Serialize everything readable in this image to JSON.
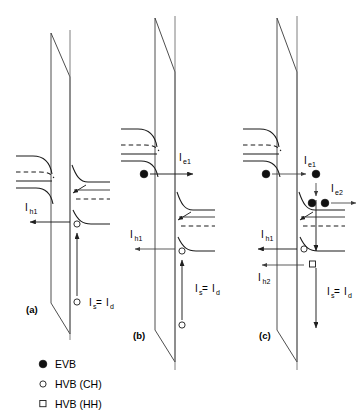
{
  "figure": {
    "panels": [
      {
        "id": "a",
        "panel_label": "(a)",
        "currents": [
          {
            "name": "I_h1",
            "base": "I",
            "sub": "h1"
          },
          {
            "name": "I_s = I_d",
            "base": "I",
            "sub": "s",
            "rest": " = I",
            "rest_sub": "d"
          }
        ],
        "carriers": [
          {
            "type": "HVB (CH)",
            "symbol": "open-circle"
          },
          {
            "type": "HVB (CH)",
            "symbol": "open-circle"
          }
        ]
      },
      {
        "id": "b",
        "panel_label": "(b)",
        "currents": [
          {
            "name": "I_e1",
            "base": "I",
            "sub": "e1"
          },
          {
            "name": "I_h1",
            "base": "I",
            "sub": "h1"
          },
          {
            "name": "I_s = I_d",
            "base": "I",
            "sub": "s",
            "rest": " = I",
            "rest_sub": "d"
          }
        ],
        "carriers": [
          {
            "type": "EVB",
            "symbol": "filled-circle"
          },
          {
            "type": "HVB (CH)",
            "symbol": "open-circle"
          },
          {
            "type": "HVB (CH)",
            "symbol": "open-circle"
          }
        ]
      },
      {
        "id": "c",
        "panel_label": "(c)",
        "currents": [
          {
            "name": "I_e1",
            "base": "I",
            "sub": "e1"
          },
          {
            "name": "I_e2",
            "base": "I",
            "sub": "e2"
          },
          {
            "name": "I_h1",
            "base": "I",
            "sub": "h1"
          },
          {
            "name": "I_h2",
            "base": "I",
            "sub": "h2"
          },
          {
            "name": "I_s = I_d",
            "base": "I",
            "sub": "s",
            "rest": " = I",
            "rest_sub": "d"
          }
        ],
        "carriers": [
          {
            "type": "EVB",
            "symbol": "filled-circle"
          },
          {
            "type": "EVB",
            "symbol": "filled-circle"
          },
          {
            "type": "EVB",
            "symbol": "filled-circle"
          },
          {
            "type": "EVB",
            "symbol": "filled-circle"
          },
          {
            "type": "HVB (CH)",
            "symbol": "open-circle"
          },
          {
            "type": "HVB (HH)",
            "symbol": "open-square"
          }
        ]
      }
    ],
    "labels": {
      "panel_a": "(a)",
      "panel_b": "(b)",
      "panel_c": "(c)",
      "I": "I",
      "e1": "e1",
      "e2": "e2",
      "h1": "h1",
      "h2": "h2",
      "s": "s",
      "d": "d",
      "equals": " = ",
      "I_e1_a": "I",
      "I_e1_b": "e1"
    },
    "legend": {
      "items": [
        {
          "symbol": "filled-circle",
          "label": "EVB"
        },
        {
          "symbol": "open-circle",
          "label": "HVB (CH)"
        },
        {
          "symbol": "open-square",
          "label": "HVB (HH)"
        }
      ]
    },
    "colors": {
      "band_line": "#1a1a1a",
      "barrier": "#3a3a3a",
      "interface": "#6f6f6f",
      "arrow": "#1f1f1f",
      "carrier_fill": "#111111",
      "background": "#ffffff"
    }
  }
}
